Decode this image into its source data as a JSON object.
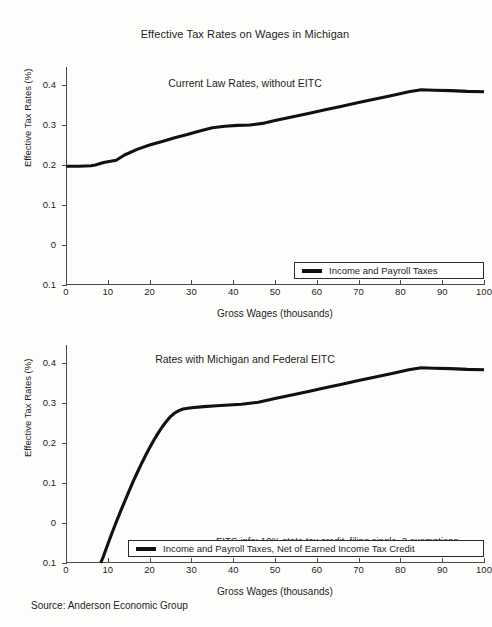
{
  "figure": {
    "title": "Effective Tax Rates on Wages in Michigan",
    "source": "Source: Anderson Economic Group"
  },
  "chart_data": [
    {
      "type": "line",
      "title": "Current Law Rates, without EITC",
      "xlabel": "Gross Wages (thousands)",
      "ylabel": "Effective Tax Rates (%)",
      "xlim": [
        0,
        100
      ],
      "ylim": [
        -0.1,
        0.4
      ],
      "xticks": [
        0,
        10,
        20,
        30,
        40,
        50,
        60,
        70,
        80,
        90,
        100
      ],
      "xticklabels": [
        "0",
        "10",
        "20",
        "30",
        "40",
        "50",
        "60",
        "70",
        "80",
        "90",
        "100"
      ],
      "yticks": [
        -0.1,
        0,
        0.1,
        0.2,
        0.3,
        0.4
      ],
      "yticklabels": [
        "0.1",
        "0",
        "0.1",
        "0.2",
        "0.3",
        "0.4"
      ],
      "grid": false,
      "legend_position": "lower right",
      "series": [
        {
          "name": "Income and Payroll Taxes",
          "color": "#111111",
          "x": [
            0,
            3,
            6,
            7,
            9,
            11,
            12,
            14,
            17,
            20,
            23,
            26,
            29,
            32,
            35,
            38,
            41,
            44,
            47,
            50,
            54,
            58,
            62,
            66,
            70,
            74,
            78,
            82,
            85,
            88,
            92,
            96,
            100
          ],
          "y": [
            0.197,
            0.197,
            0.198,
            0.2,
            0.206,
            0.21,
            0.212,
            0.225,
            0.239,
            0.25,
            0.259,
            0.268,
            0.276,
            0.285,
            0.293,
            0.297,
            0.299,
            0.3,
            0.304,
            0.311,
            0.32,
            0.329,
            0.338,
            0.347,
            0.356,
            0.365,
            0.374,
            0.383,
            0.388,
            0.387,
            0.386,
            0.384,
            0.383
          ]
        }
      ]
    },
    {
      "type": "line",
      "title": "Rates with  Michigan and Federal EITC",
      "xlabel": "Gross Wages (thousands)",
      "ylabel": "Effective Tax Rates (%)",
      "xlim": [
        0,
        100
      ],
      "ylim": [
        -0.1,
        0.4
      ],
      "xticks": [
        0,
        10,
        20,
        30,
        40,
        50,
        60,
        70,
        80,
        90,
        100
      ],
      "xticklabels": [
        "0",
        "10",
        "20",
        "30",
        "40",
        "50",
        "60",
        "70",
        "80",
        "90",
        "100"
      ],
      "yticks": [
        -0.1,
        0,
        0.1,
        0.2,
        0.3,
        0.4
      ],
      "yticklabels": [
        "0.1",
        "0",
        "0.1",
        "0.2",
        "0.3",
        "0.4"
      ],
      "grid": false,
      "legend_position": "lower center",
      "annotation": "EITC info: 10% state tax credit, filing single, 2 exemptions",
      "series": [
        {
          "name": "Income and Payroll Taxes, Net of Earned Income Tax Credit",
          "color": "#111111",
          "x": [
            8.3,
            9,
            10,
            11,
            12,
            13,
            14,
            15,
            16,
            17,
            18,
            19,
            20,
            21,
            22,
            23,
            24,
            25,
            26,
            27,
            28,
            30,
            33,
            36,
            39,
            42,
            46,
            50,
            54,
            58,
            62,
            66,
            70,
            74,
            78,
            82,
            85,
            88,
            92,
            96,
            100
          ],
          "y": [
            -0.1,
            -0.082,
            -0.053,
            -0.025,
            0.002,
            0.028,
            0.053,
            0.078,
            0.102,
            0.125,
            0.147,
            0.168,
            0.188,
            0.207,
            0.224,
            0.24,
            0.254,
            0.266,
            0.275,
            0.281,
            0.285,
            0.288,
            0.291,
            0.293,
            0.295,
            0.297,
            0.302,
            0.311,
            0.32,
            0.329,
            0.338,
            0.347,
            0.356,
            0.365,
            0.374,
            0.383,
            0.388,
            0.387,
            0.386,
            0.384,
            0.383
          ]
        }
      ]
    }
  ]
}
